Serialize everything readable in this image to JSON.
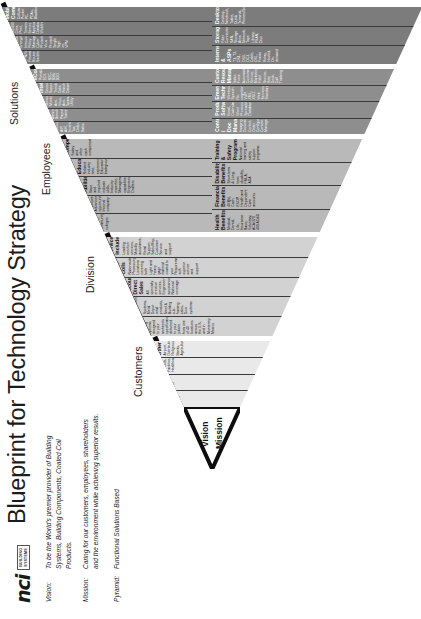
{
  "brand": {
    "logo_text": "nci",
    "logo_sub_line1": "BUILDING",
    "logo_sub_line2": "SYSTEMS"
  },
  "title": "Blueprint for Technology Strategy",
  "statements": {
    "vision_label": "Vision:",
    "vision_text": "To be the World's premier provider of Building Systems, Building Components, Coated Coil Products.",
    "mission_label": "Mission:",
    "mission_text": "Caring for our customers, employees, shareholders and the environment while achieving superior results.",
    "pyramid_label": "Pyramid:",
    "pyramid_text": "Functional Solutions Based"
  },
  "apex": {
    "vision": "Vision",
    "mission": "Mission"
  },
  "tiers": [
    {
      "label": "Customers",
      "cells": [
        {
          "head": "Commercial",
          "body": "Office, Retail, Multi-family"
        },
        {
          "head": "Industrial",
          "body": "Manufacturing, High-tech"
        },
        {
          "head": "Government",
          "body": "Schools, Facilities, Healthcare"
        },
        {
          "head": "Other",
          "body": "Airport, Distribution, Religious, Banks, Agriculture"
        }
      ]
    },
    {
      "label": "Division",
      "cells": [
        {
          "head": "Design to Spec Building Systems",
          "body": "Complete building systems designed to your architects specification delivered to your jobsite from one of 40 locations across the U.S. and in Monterrey Mexico"
        },
        {
          "head": "Building Components",
          "body": "Structural Studs, Joists, Components / Systems, Metal Depot retail products, Steel & Building sub-framing sales, Door systems"
        },
        {
          "head": "Builder Network Corp. Accounts Direct Sales",
          "body": "All specialty erection services, Engineering assistance, National coverage"
        },
        {
          "head": "Coated Steel Coils",
          "body": "Nationwide Processing Locations covering both Light and heavy gage material coated to your Requirements with superior service and support"
        },
        {
          "head": "Services Include",
          "body": "Leading erection services, Mobility assistance, Retail Support, Sales/Rep, Customer Service and support"
        }
      ]
    },
    {
      "label": "Employees",
      "cells": [
        {
          "head": "Recruitment",
          "body": "Coordinated efforts via internet, local & trade schools, community colleges"
        },
        {
          "head": "Career Growth",
          "body": "Promote total fulfilling employee Advancement opportunities, Internal company"
        },
        {
          "head": "Knowledge, Skills & Abilities",
          "body": "Base and required indicate skills, Industry expertise, Management capabilities, Engineers, Drafters"
        },
        {
          "head": "Experience & Education",
          "body": "Related industry time, experience, Educational background"
        },
        {
          "head": "Compensation",
          "body": "Salary and other cash compensation"
        },
        {
          "head": "Health Benefits",
          "body": "Medical, Dental, Life, Insurance Basic, Voluntary, ACA/271 401 AD&D"
        },
        {
          "head": "Financial Benefits",
          "body": "401(k), Cash ESOP, Health and Dependent Care accounts"
        },
        {
          "head": "Disability Benefits",
          "body": "Short-term & Long-term disability, FMLA, ADA"
        },
        {
          "head": "Training & Safety Programs",
          "body": "National training and safety support programs"
        }
      ]
    },
    {
      "label": "Solutions",
      "cells": [
        {
          "head": "Enterprise Resource Planning",
          "body": "Financial, Accounting, A/P, A/R, Inventory, Tax, Order, Sales"
        },
        {
          "head": "HR Information System",
          "body": "Administration, Benefits, Payroll, Training"
        },
        {
          "head": "Systems/Security Management",
          "body": "Network Monitoring, Anti-Virus, Anti-Spam, Utility"
        },
        {
          "head": "Business Intelligence",
          "body": "Decision Support, Trends, Data Warehouse, Datamining"
        },
        {
          "head": "eCommerce",
          "body": "Portals, EDI, B2C, B2B, B2G"
        },
        {
          "head": "Content / Doc Management",
          "body": "Imaging, Document Control, Order Configuration, Content Management"
        },
        {
          "head": "Productivity Software",
          "body": "Email, Calendar, Word Processing, Spreadsheet, Database"
        },
        {
          "head": "Emerging Technologies",
          "body": "Wireless, Speech Re-cognition, VoIP, XML, XSLT, Web Services, Standards"
        },
        {
          "head": "Customer Resource Management",
          "body": "Sales Force Automation, Customer Service, Marketing, Field Service, Help Desk, Call Tracking"
        }
      ]
    },
    {
      "label": "Infrastructure",
      "cells": [
        {
          "head": "Network",
          "body": "Copper/Fiber Cabling, Wi-Fi, VPN/WAN/LAN, Firewall, Routers, Switches"
        },
        {
          "head": "Security",
          "body": "SPAM/Virus Protection, Encryption, Intrusion, Policy Management, Cyber Protection, Virus Protection, Single Sign-on, VPN"
        },
        {
          "head": "Server/OS",
          "body": "AS/400, Citrix, Print, Terminal Server, Application, Database, Web/Intranet/Internet"
        },
        {
          "head": "Mobile Communications",
          "body": "Cellular, Pocket PC, PDAs, Blackberry"
        },
        {
          "head": "Internet & ASPs",
          "body": "T1, T3, DS1, DS3, OC3, Cable, DSL, Frame Relay, Hosted, On-demand"
        },
        {
          "head": "Storage/Backup",
          "body": "Fiber Connected SAN, Storage Area Network, Tape Library, FSAN, Disc"
        },
        {
          "head": "Desktop/Laptop",
          "body": "Desktop, Notebook, Tablet, Dumb Terminal, Printers/Scanners"
        }
      ]
    }
  ]
}
